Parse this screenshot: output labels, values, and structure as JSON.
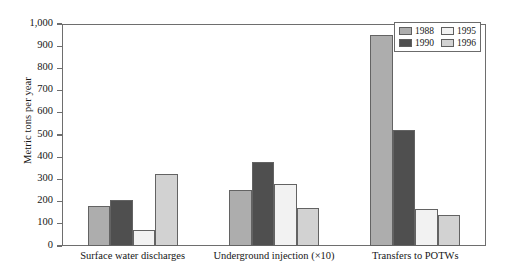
{
  "chart_data": {
    "type": "bar",
    "title": "",
    "xlabel": "",
    "ylabel": "Metric tons per year",
    "ylim": [
      0,
      1000
    ],
    "ytick_labels": [
      "1,000",
      "900",
      "800",
      "700",
      "600",
      "500",
      "400",
      "300",
      "200",
      "100",
      "0"
    ],
    "ytick_values": [
      1000,
      900,
      800,
      700,
      600,
      500,
      400,
      300,
      200,
      100,
      0
    ],
    "grid": false,
    "legend_position": "top-right",
    "categories": [
      "Surface water discharges",
      "Underground injection (×10)",
      "Transfers to POTWs"
    ],
    "series": [
      {
        "name": "1988",
        "color": "#adadad",
        "values": [
          182,
          252,
          950
        ]
      },
      {
        "name": "1990",
        "color": "#4f4f4f",
        "values": [
          207,
          380,
          523
        ]
      },
      {
        "name": "1995",
        "color": "#f2f2f2",
        "values": [
          72,
          278,
          165
        ]
      },
      {
        "name": "1996",
        "color": "#d2d2d2",
        "values": [
          325,
          172,
          138
        ]
      }
    ]
  },
  "legend": {
    "entries": [
      {
        "label": "1988",
        "color": "#adadad"
      },
      {
        "label": "1995",
        "color": "#f2f2f2"
      },
      {
        "label": "1990",
        "color": "#4f4f4f"
      },
      {
        "label": "1996",
        "color": "#d2d2d2"
      }
    ]
  },
  "axes": {
    "frame_color": "#6e6e6e",
    "bar_edge_color": "#636363"
  }
}
